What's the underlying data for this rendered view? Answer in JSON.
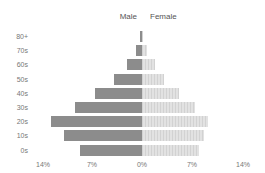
{
  "chart_data": {
    "type": "bar",
    "subtype": "population-pyramid",
    "title": "",
    "xlabel": "",
    "ylabel": "",
    "categories": [
      "80+",
      "70s",
      "60s",
      "50s",
      "40s",
      "30s",
      "20s",
      "10s",
      "0s"
    ],
    "series": [
      {
        "name": "Male",
        "color": "#8c8c8c",
        "side": "left",
        "values": [
          0.3,
          0.8,
          2.1,
          3.9,
          6.5,
          9.3,
          12.6,
          10.8,
          8.6
        ]
      },
      {
        "name": "Female",
        "color": "#dedede",
        "side": "right",
        "values": [
          0.2,
          0.7,
          1.8,
          3.0,
          5.1,
          7.4,
          9.2,
          8.6,
          7.9
        ]
      }
    ],
    "xlim": [
      -14,
      14
    ],
    "xticks": [
      "14%",
      "7%",
      "0%",
      "7%",
      "14%"
    ],
    "legend": {
      "position": "top-center",
      "entries": [
        "Male",
        "Female"
      ]
    },
    "grid": false
  },
  "legend": {
    "male_label": "Male",
    "female_label": "Female"
  },
  "axis": {
    "ticks": [
      "14%",
      "7%",
      "0%",
      "7%",
      "14%"
    ]
  },
  "rows": [
    {
      "label": "80+"
    },
    {
      "label": "70s"
    },
    {
      "label": "60s"
    },
    {
      "label": "50s"
    },
    {
      "label": "40s"
    },
    {
      "label": "30s"
    },
    {
      "label": "20s"
    },
    {
      "label": "10s"
    },
    {
      "label": "0s"
    }
  ]
}
